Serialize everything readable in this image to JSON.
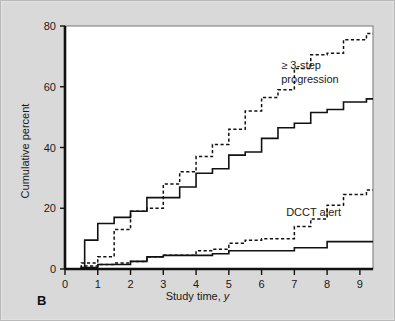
{
  "figure": {
    "panel_label": "B",
    "background_color": "#d9d9d9",
    "plot_background_color": "#ffffff",
    "line_color": "#111111"
  },
  "annotations": [
    {
      "id": "upper",
      "line1": "≥ 3-step",
      "line2": "progression",
      "x": 6.6,
      "y": 66
    },
    {
      "id": "lower",
      "line1": "DCCT alert",
      "line2": "",
      "x": 6.75,
      "y": 17.5
    }
  ],
  "chart_data": {
    "type": "line",
    "title": "",
    "subtitle": "",
    "xlabel": "Study time, y",
    "ylabel": "Cumulative percent",
    "xlim": [
      0,
      9.4
    ],
    "ylim": [
      0,
      80
    ],
    "xticks": [
      0,
      1,
      2,
      3,
      4,
      5,
      6,
      7,
      8,
      9
    ],
    "yticks": [
      0,
      20,
      40,
      60,
      80
    ],
    "xtick_labels": [
      "0",
      "1",
      "2",
      "3",
      "4",
      "5",
      "6",
      "7",
      "8",
      "9"
    ],
    "ytick_labels": [
      "0",
      "20",
      "40",
      "60",
      "80"
    ],
    "grid": false,
    "legend": "annotated-inline",
    "step_style": "post",
    "series": [
      {
        "name": "≥ 3-step progression (dashed)",
        "style": "dashed",
        "annotation": "≥ 3-step progression",
        "x": [
          0.5,
          1.0,
          1.5,
          2.0,
          2.5,
          3.0,
          3.5,
          4.0,
          4.5,
          5.0,
          5.5,
          6.0,
          6.5,
          7.0,
          7.5,
          8.0,
          8.5,
          9.2
        ],
        "y": [
          2.0,
          4.0,
          13.0,
          19.0,
          20.0,
          28.0,
          32.0,
          37.0,
          41.0,
          46.0,
          52.0,
          56.5,
          59.0,
          66.0,
          70.5,
          71.0,
          75.5,
          77.5
        ]
      },
      {
        "name": "≥ 3-step progression (solid)",
        "style": "solid",
        "annotation": "≥ 3-step progression",
        "x": [
          0.6,
          1.0,
          1.5,
          2.0,
          2.5,
          3.0,
          3.5,
          4.0,
          4.5,
          5.0,
          5.5,
          6.0,
          6.5,
          7.0,
          7.5,
          8.0,
          8.5,
          9.2
        ],
        "y": [
          9.5,
          15.0,
          17.0,
          19.0,
          23.5,
          23.5,
          27.0,
          31.5,
          33.0,
          37.5,
          38.5,
          43.0,
          46.5,
          48.0,
          51.5,
          52.5,
          55.0,
          56.0
        ]
      },
      {
        "name": "DCCT alert (dashed)",
        "style": "dashed",
        "annotation": "DCCT alert",
        "x": [
          0.5,
          1.0,
          1.5,
          2.0,
          2.5,
          3.0,
          3.5,
          4.0,
          4.5,
          5.0,
          5.5,
          6.0,
          6.5,
          7.0,
          7.5,
          8.0,
          8.5,
          9.2
        ],
        "y": [
          1.0,
          1.5,
          2.0,
          2.5,
          4.0,
          4.5,
          4.5,
          6.0,
          6.5,
          8.5,
          9.5,
          10.0,
          10.0,
          14.0,
          16.5,
          21.0,
          24.5,
          26.0
        ]
      },
      {
        "name": "DCCT alert (solid)",
        "style": "solid",
        "annotation": "DCCT alert",
        "x": [
          0.5,
          1.0,
          1.5,
          2.0,
          2.5,
          3.0,
          3.5,
          4.0,
          4.5,
          5.0,
          5.5,
          6.0,
          6.5,
          7.0,
          7.5,
          8.0,
          8.5,
          9.2
        ],
        "y": [
          0.5,
          1.5,
          1.5,
          2.5,
          4.0,
          4.5,
          4.5,
          4.5,
          5.0,
          6.0,
          6.0,
          6.0,
          6.0,
          7.0,
          7.0,
          9.0,
          9.0,
          9.0
        ]
      }
    ]
  }
}
